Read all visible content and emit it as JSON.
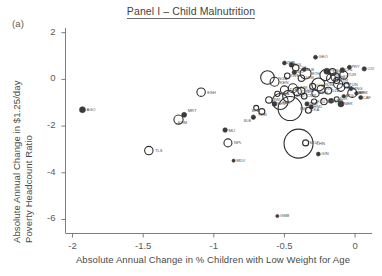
{
  "figure": {
    "panel_marker": "(a)",
    "title": "Panel I – Child Malnutrition",
    "background_color": "#ffffff",
    "marker_color": "#2e2e2e"
  },
  "axes": {
    "ylabel_line1": "Absolute Annual Change in $1.25/day",
    "ylabel_line2": "Poverty Headcount Ratio",
    "xlabel": "Absolute Annual Change in % Children with Low Weight for Age",
    "y_ticks": [
      "2",
      "0",
      "-2",
      "-4",
      "-6"
    ],
    "x_ticks": [
      "-2",
      "-1.5",
      "-1",
      "-0.5",
      "0",
      "0.5",
      "0.1"
    ]
  },
  "chart_data": {
    "type": "scatter",
    "title": "Panel I – Child Malnutrition",
    "xlabel": "Absolute Annual Change in % Children with Low Weight for Age",
    "ylabel": "Absolute Annual Change in $1.25/day Poverty Headcount Ratio",
    "xlim": [
      -2.05,
      0.12
    ],
    "ylim": [
      -6.6,
      2.2
    ],
    "xticks": [
      -2,
      -1.5,
      -1,
      -0.5,
      0,
      0.5,
      1
    ],
    "xticklabels": [
      "-2",
      "-1.5",
      "-1",
      "-0.5",
      "0",
      "0.5",
      "0.1"
    ],
    "yticks": [
      2,
      0,
      -2,
      -4,
      -6
    ],
    "yticklabels": [
      "2",
      "0",
      "-2",
      "-4",
      "-6"
    ],
    "grid": false,
    "legend": null,
    "size_encoding": "bubble area proportional to population",
    "points": [
      {
        "label": "AGO",
        "x": -1.93,
        "y": -1.3,
        "size": 3.0,
        "filled": true,
        "lx": 5,
        "ly": 1.5
      },
      {
        "label": "TLS",
        "x": -1.46,
        "y": -3.05,
        "size": 4.2,
        "filled": false,
        "lx": 6,
        "ly": 1.5
      },
      {
        "label": "ESH",
        "x": -1.09,
        "y": -0.55,
        "size": 4.2,
        "filled": false,
        "lx": 6,
        "ly": 1.5
      },
      {
        "label": "MRT",
        "x": -1.21,
        "y": -1.52,
        "size": 2.5,
        "filled": true,
        "lx": 5,
        "ly": -2.5
      },
      {
        "label": "KHM",
        "x": -1.25,
        "y": -1.72,
        "size": 4.6,
        "filled": false,
        "lx": -1,
        "ly": 4.5
      },
      {
        "label": "MLI",
        "x": -0.92,
        "y": -2.17,
        "size": 2.3,
        "filled": true,
        "lx": 5,
        "ly": 1.5
      },
      {
        "label": "NPL",
        "x": -0.9,
        "y": -2.72,
        "size": 4.0,
        "filled": false,
        "lx": 6,
        "ly": 1.5
      },
      {
        "label": "MDV",
        "x": -0.86,
        "y": -3.48,
        "size": 1.6,
        "filled": true,
        "lx": 5,
        "ly": 1.5
      },
      {
        "label": "SLE",
        "x": -0.72,
        "y": -1.62,
        "size": 2.2,
        "filled": true,
        "lx": -8,
        "ly": 4.5
      },
      {
        "label": "NGA",
        "x": -0.62,
        "y": 0.08,
        "size": 6.8,
        "filled": false,
        "lx": 8,
        "ly": 2.5
      },
      {
        "label": "ZMB",
        "x": -0.5,
        "y": 0.7,
        "size": 2.0,
        "filled": true,
        "lx": 4,
        "ly": 1.0
      },
      {
        "label": "BOL",
        "x": -0.45,
        "y": 0.62,
        "size": 2.4,
        "filled": true,
        "lx": 4,
        "ly": 1.0
      },
      {
        "label": "COL",
        "x": -0.42,
        "y": 0.5,
        "size": 3.2,
        "filled": false,
        "lx": 4,
        "ly": 1.0
      },
      {
        "label": "GEO",
        "x": -0.28,
        "y": 0.95,
        "size": 2.0,
        "filled": true,
        "lx": 5,
        "ly": 1.0
      },
      {
        "label": "ETH",
        "x": -0.35,
        "y": 0.25,
        "size": 5.5,
        "filled": false,
        "lx": 5,
        "ly": 1.5
      },
      {
        "label": "KEN",
        "x": -0.57,
        "y": -0.1,
        "size": 4.5,
        "filled": false,
        "lx": 5,
        "ly": 2.0
      },
      {
        "label": "IND",
        "x": -0.46,
        "y": -1.25,
        "size": 12.0,
        "filled": false,
        "lx": 2,
        "ly": 1.0
      },
      {
        "label": "CHN",
        "x": -0.4,
        "y": -2.75,
        "size": 14.5,
        "filled": false,
        "lx": 7,
        "ly": 1.0
      },
      {
        "label": "MOZ",
        "x": -0.35,
        "y": -2.72,
        "size": 3.0,
        "filled": false,
        "lx": 5,
        "ly": 1.0
      },
      {
        "label": "GIN",
        "x": -0.26,
        "y": -3.2,
        "size": 2.0,
        "filled": true,
        "lx": 5,
        "ly": 1.0
      },
      {
        "label": "PAK",
        "x": -0.53,
        "y": -0.95,
        "size": 8.0,
        "filled": false,
        "lx": -2,
        "ly": 2.0
      },
      {
        "label": "BGD",
        "x": -0.47,
        "y": -0.72,
        "size": 6.0,
        "filled": false,
        "lx": 5,
        "ly": 1.0
      },
      {
        "label": "TZA",
        "x": -0.5,
        "y": -0.45,
        "size": 4.0,
        "filled": false,
        "lx": 5,
        "ly": 1.0
      },
      {
        "label": "VNM",
        "x": -0.44,
        "y": -0.38,
        "size": 4.5,
        "filled": false,
        "lx": 5,
        "ly": 1.0
      },
      {
        "label": "UGA",
        "x": -0.38,
        "y": -0.5,
        "size": 3.5,
        "filled": false,
        "lx": 4,
        "ly": 1.0
      },
      {
        "label": "GHA",
        "x": -0.3,
        "y": -0.3,
        "size": 3.0,
        "filled": false,
        "lx": 4,
        "ly": 1.0
      },
      {
        "label": "IDN",
        "x": -0.26,
        "y": -0.22,
        "size": 6.5,
        "filled": false,
        "lx": 5,
        "ly": 1.0
      },
      {
        "label": "BRA",
        "x": -0.21,
        "y": 0.18,
        "size": 5.5,
        "filled": false,
        "lx": 5,
        "ly": 1.0
      },
      {
        "label": "MEX",
        "x": -0.17,
        "y": 0.05,
        "size": 4.5,
        "filled": false,
        "lx": 4,
        "ly": 1.0
      },
      {
        "label": "PER",
        "x": -0.2,
        "y": 0.35,
        "size": 3.0,
        "filled": true,
        "lx": 4,
        "ly": 1.0
      },
      {
        "label": "EGY",
        "x": -0.14,
        "y": 0.1,
        "size": 4.2,
        "filled": false,
        "lx": 4,
        "ly": 1.0
      },
      {
        "label": "PHL",
        "x": -0.12,
        "y": -0.2,
        "size": 4.5,
        "filled": false,
        "lx": 4,
        "ly": 1.0
      },
      {
        "label": "THA",
        "x": -0.1,
        "y": -0.35,
        "size": 3.8,
        "filled": false,
        "lx": 4,
        "ly": 1.0
      },
      {
        "label": "TUR",
        "x": -0.08,
        "y": 0.18,
        "size": 4.0,
        "filled": false,
        "lx": 4,
        "ly": 1.0
      },
      {
        "label": "PRY",
        "x": -0.04,
        "y": 0.52,
        "size": 2.0,
        "filled": true,
        "lx": 4,
        "ly": 1.0
      },
      {
        "label": "ARM",
        "x": 0.01,
        "y": -0.6,
        "size": 1.8,
        "filled": true,
        "lx": 4,
        "ly": 1.0
      },
      {
        "label": "CAF",
        "x": 0.04,
        "y": -0.78,
        "size": 2.0,
        "filled": true,
        "lx": 4,
        "ly": 1.0
      },
      {
        "label": "ATG",
        "x": -0.08,
        "y": -0.72,
        "size": 1.8,
        "filled": true,
        "lx": 4,
        "ly": 1.0
      },
      {
        "label": "JOR",
        "x": -0.13,
        "y": -0.85,
        "size": 2.5,
        "filled": false,
        "lx": 4,
        "ly": 1.0
      },
      {
        "label": "NAM",
        "x": -0.17,
        "y": -0.92,
        "size": 2.5,
        "filled": true,
        "lx": 4,
        "ly": 1.0
      },
      {
        "label": "NER",
        "x": -0.1,
        "y": -1.05,
        "size": 3.0,
        "filled": true,
        "lx": 4,
        "ly": 1.0
      },
      {
        "label": "ZAF",
        "x": -0.02,
        "y": -0.58,
        "size": 4.5,
        "filled": false,
        "lx": 4,
        "ly": 1.0
      },
      {
        "label": "CIV",
        "x": 0.065,
        "y": 0.45,
        "size": 2.2,
        "filled": true,
        "lx": 5,
        "ly": 1.0
      },
      {
        "label": "GMB",
        "x": -0.55,
        "y": -5.85,
        "size": 1.6,
        "filled": true,
        "lx": 5,
        "ly": 1.0
      },
      {
        "label": "YEM",
        "x": -0.66,
        "y": -1.38,
        "size": 3.0,
        "filled": false,
        "lx": -3,
        "ly": 4.0
      },
      {
        "label": "BFA",
        "x": -0.7,
        "y": -1.22,
        "size": 2.5,
        "filled": false,
        "lx": -3,
        "ly": 4.0
      },
      {
        "label": "MWI",
        "x": -0.61,
        "y": -0.88,
        "size": 3.2,
        "filled": false,
        "lx": 4,
        "ly": 1.0
      },
      {
        "label": "RWA",
        "x": -0.55,
        "y": -0.62,
        "size": 2.6,
        "filled": false,
        "lx": 4,
        "ly": 1.0
      },
      {
        "label": "SEN",
        "x": -0.57,
        "y": -1.05,
        "size": 2.4,
        "filled": true,
        "lx": 4,
        "ly": 1.0
      },
      {
        "label": "TCD",
        "x": -0.34,
        "y": -1.05,
        "size": 2.2,
        "filled": true,
        "lx": 4,
        "ly": 1.0
      },
      {
        "label": "ECU",
        "x": -0.29,
        "y": -0.95,
        "size": 2.6,
        "filled": false,
        "lx": 4,
        "ly": 1.0
      },
      {
        "label": "HND",
        "x": -0.31,
        "y": -1.18,
        "size": 2.2,
        "filled": true,
        "lx": 4,
        "ly": 1.0
      },
      {
        "label": "LKA",
        "x": -0.33,
        "y": -1.32,
        "size": 3.0,
        "filled": false,
        "lx": 4,
        "ly": 1.0
      },
      {
        "label": "MAR",
        "x": -0.22,
        "y": -0.95,
        "size": 3.2,
        "filled": false,
        "lx": 4,
        "ly": 1.0
      },
      {
        "label": "DZA",
        "x": -0.19,
        "y": -0.48,
        "size": 3.4,
        "filled": false,
        "lx": 4,
        "ly": 1.0
      },
      {
        "label": "IRN",
        "x": -0.24,
        "y": -0.42,
        "size": 4.0,
        "filled": false,
        "lx": 4,
        "ly": 1.0
      },
      {
        "label": "SDN",
        "x": -0.28,
        "y": -0.6,
        "size": 3.6,
        "filled": false,
        "lx": 4,
        "ly": 1.0
      },
      {
        "label": "CMR",
        "x": -0.36,
        "y": -0.72,
        "size": 2.8,
        "filled": false,
        "lx": 4,
        "ly": 1.0
      },
      {
        "label": "COD",
        "x": -0.41,
        "y": -0.52,
        "size": 4.2,
        "filled": false,
        "lx": 4,
        "ly": 1.0
      },
      {
        "label": "TUN",
        "x": -0.06,
        "y": -0.25,
        "size": 2.6,
        "filled": false,
        "lx": 4,
        "ly": 1.0
      },
      {
        "label": "MNG",
        "x": -0.03,
        "y": -0.4,
        "size": 2.0,
        "filled": true,
        "lx": 4,
        "ly": 1.0
      },
      {
        "label": "SYR",
        "x": -0.13,
        "y": -0.05,
        "size": 3.0,
        "filled": false,
        "lx": 4,
        "ly": 1.0
      },
      {
        "label": "VEN",
        "x": -0.16,
        "y": 0.32,
        "size": 3.4,
        "filled": false,
        "lx": 4,
        "ly": 1.0
      },
      {
        "label": "CHL",
        "x": -0.09,
        "y": 0.4,
        "size": 2.4,
        "filled": true,
        "lx": 4,
        "ly": 1.0
      },
      {
        "label": "ALB",
        "x": -0.36,
        "y": 0.42,
        "size": 2.0,
        "filled": true,
        "lx": 4,
        "ly": 1.0
      },
      {
        "label": "NIC",
        "x": -0.43,
        "y": 0.3,
        "size": 2.2,
        "filled": true,
        "lx": 4,
        "ly": 1.0
      },
      {
        "label": "GTM",
        "x": -0.38,
        "y": 0.05,
        "size": 3.2,
        "filled": false,
        "lx": 4,
        "ly": 1.0
      },
      {
        "label": "ZWE",
        "x": -0.48,
        "y": 0.15,
        "size": 2.8,
        "filled": false,
        "lx": 4,
        "ly": 1.0
      }
    ]
  }
}
